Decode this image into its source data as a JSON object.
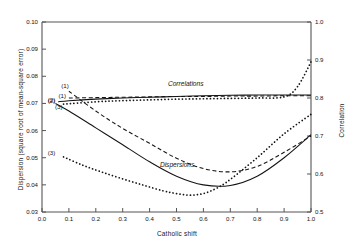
{
  "figure": {
    "background": "#ffffff",
    "frame_color": "#555555"
  },
  "chart_data": {
    "type": "line",
    "title": "",
    "xlabel": "Catholic shift",
    "ylabel": "Dispersion (square root of mean-square error)",
    "ylabel_right": "Correlation",
    "xlim": [
      0.0,
      1.0
    ],
    "ylim": [
      0.03,
      0.1
    ],
    "ylim_right": [
      0.5,
      1.0
    ],
    "grid": false,
    "legend_position": "inline-annotations",
    "xticks": [
      "0.0",
      "0.1",
      "0.2",
      "0.3",
      "0.4",
      "0.5",
      "0.6",
      "0.7",
      "0.8",
      "0.9",
      "1.0"
    ],
    "xtick_values": [
      0.0,
      0.1,
      0.2,
      0.3,
      0.4,
      0.5,
      0.6,
      0.7,
      0.8,
      0.9,
      1.0
    ],
    "yticks_left": [
      "0.03",
      "0.04",
      "0.05",
      "0.06",
      "0.07",
      "0.08",
      "0.09",
      "0.10"
    ],
    "ytick_values_left": [
      0.03,
      0.04,
      0.05,
      0.06,
      0.07,
      0.08,
      0.09,
      0.1
    ],
    "yticks_right": [
      "0.5",
      "0.6",
      "0.7",
      "0.8",
      "0.9",
      "1.0"
    ],
    "ytick_values_right": [
      0.5,
      0.6,
      0.7,
      0.8,
      0.9,
      1.0
    ],
    "annotations": [
      {
        "text": "Correlations",
        "x": 0.55,
        "y_right": 0.815,
        "style": "italic"
      },
      {
        "text": "Dispersions",
        "x": 0.52,
        "y_left": 0.0445,
        "style": "italic"
      }
    ],
    "group_labels": {
      "correlations": "Correlations",
      "dispersions": "Dispersions"
    },
    "curve_tags": [
      {
        "label": "(1)",
        "group": "dispersions",
        "x": 0.105,
        "y_left": 0.0765
      },
      {
        "label": "(2)",
        "group": "dispersions",
        "x": 0.055,
        "y_left": 0.0712
      },
      {
        "label": "(3)",
        "group": "dispersions",
        "x": 0.055,
        "y_left": 0.0518
      },
      {
        "label": "(1)",
        "group": "correlations",
        "x": 0.095,
        "y_right": 0.806
      },
      {
        "label": "(2)",
        "group": "correlations",
        "x": 0.055,
        "y_right": 0.792
      },
      {
        "label": "(3)",
        "group": "correlations",
        "x": 0.082,
        "y_right": 0.776
      }
    ],
    "series": [
      {
        "name": "Dispersion (1)",
        "axis": "left",
        "tag": "(1)",
        "style": "dashed",
        "color": "#141414",
        "x": [
          0.1,
          0.2,
          0.3,
          0.4,
          0.5,
          0.6,
          0.7,
          0.8,
          0.9,
          1.0
        ],
        "values": [
          0.0745,
          0.0672,
          0.0608,
          0.0553,
          0.0498,
          0.046,
          0.0448,
          0.0468,
          0.052,
          0.058
        ]
      },
      {
        "name": "Dispersion (2)",
        "axis": "left",
        "tag": "(2)",
        "style": "solid",
        "color": "#141414",
        "x": [
          0.05,
          0.1,
          0.2,
          0.3,
          0.4,
          0.5,
          0.6,
          0.7,
          0.8,
          0.9,
          1.0
        ],
        "values": [
          0.07,
          0.0672,
          0.061,
          0.0548,
          0.0485,
          0.0432,
          0.04,
          0.0398,
          0.0432,
          0.05,
          0.0585
        ]
      },
      {
        "name": "Dispersion (3)",
        "axis": "left",
        "tag": "(3)",
        "style": "dotted",
        "color": "#141414",
        "x": [
          0.08,
          0.15,
          0.22,
          0.3,
          0.38,
          0.45,
          0.5,
          0.55,
          0.6,
          0.65,
          0.7,
          0.8,
          0.9,
          1.0
        ],
        "values": [
          0.0503,
          0.0473,
          0.0448,
          0.0422,
          0.0398,
          0.0378,
          0.0368,
          0.0362,
          0.0368,
          0.0388,
          0.042,
          0.05,
          0.0588,
          0.066
        ]
      },
      {
        "name": "Correlation (1)",
        "axis": "right",
        "tag": "(1)",
        "style": "dashed",
        "color": "#141414",
        "x": [
          0.1,
          0.2,
          0.3,
          0.4,
          0.5,
          0.6,
          0.7,
          0.8,
          0.9,
          1.0
        ],
        "values": [
          0.8,
          0.801,
          0.802,
          0.803,
          0.804,
          0.804,
          0.805,
          0.805,
          0.806,
          0.806
        ]
      },
      {
        "name": "Correlation (2)",
        "axis": "right",
        "tag": "(2)",
        "style": "solid",
        "color": "#141414",
        "x": [
          0.06,
          0.1,
          0.2,
          0.3,
          0.4,
          0.5,
          0.6,
          0.7,
          0.8,
          0.9,
          1.0
        ],
        "values": [
          0.79,
          0.793,
          0.797,
          0.8,
          0.802,
          0.804,
          0.806,
          0.807,
          0.808,
          0.808,
          0.808
        ]
      },
      {
        "name": "Correlation (3)",
        "axis": "right",
        "tag": "(3)",
        "style": "dotted",
        "color": "#141414",
        "x": [
          0.08,
          0.2,
          0.3,
          0.4,
          0.5,
          0.6,
          0.7,
          0.8,
          0.9,
          0.95,
          1.0
        ],
        "values": [
          0.784,
          0.79,
          0.793,
          0.795,
          0.797,
          0.798,
          0.799,
          0.8,
          0.803,
          0.83,
          0.895
        ]
      }
    ]
  }
}
